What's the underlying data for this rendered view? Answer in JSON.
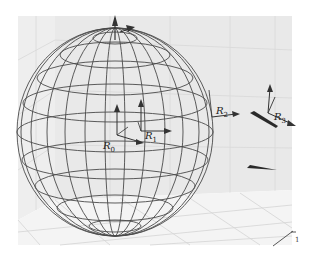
{
  "figure": {
    "colors": {
      "background": "#ffffff",
      "box_wall": "#ededed",
      "box_floor": "#f3f3f3",
      "grid": "#d6d6d6",
      "wire": "#555555",
      "arrow": "#333333"
    }
  },
  "frames": [
    {
      "id": "R0",
      "letter": "R",
      "sub": "0"
    },
    {
      "id": "R1",
      "letter": "R",
      "sub": "1"
    },
    {
      "id": "R2",
      "letter": "R",
      "sub": "2"
    },
    {
      "id": "R3",
      "letter": "R",
      "sub": "3"
    }
  ],
  "axis": {
    "tick_label": "1"
  }
}
